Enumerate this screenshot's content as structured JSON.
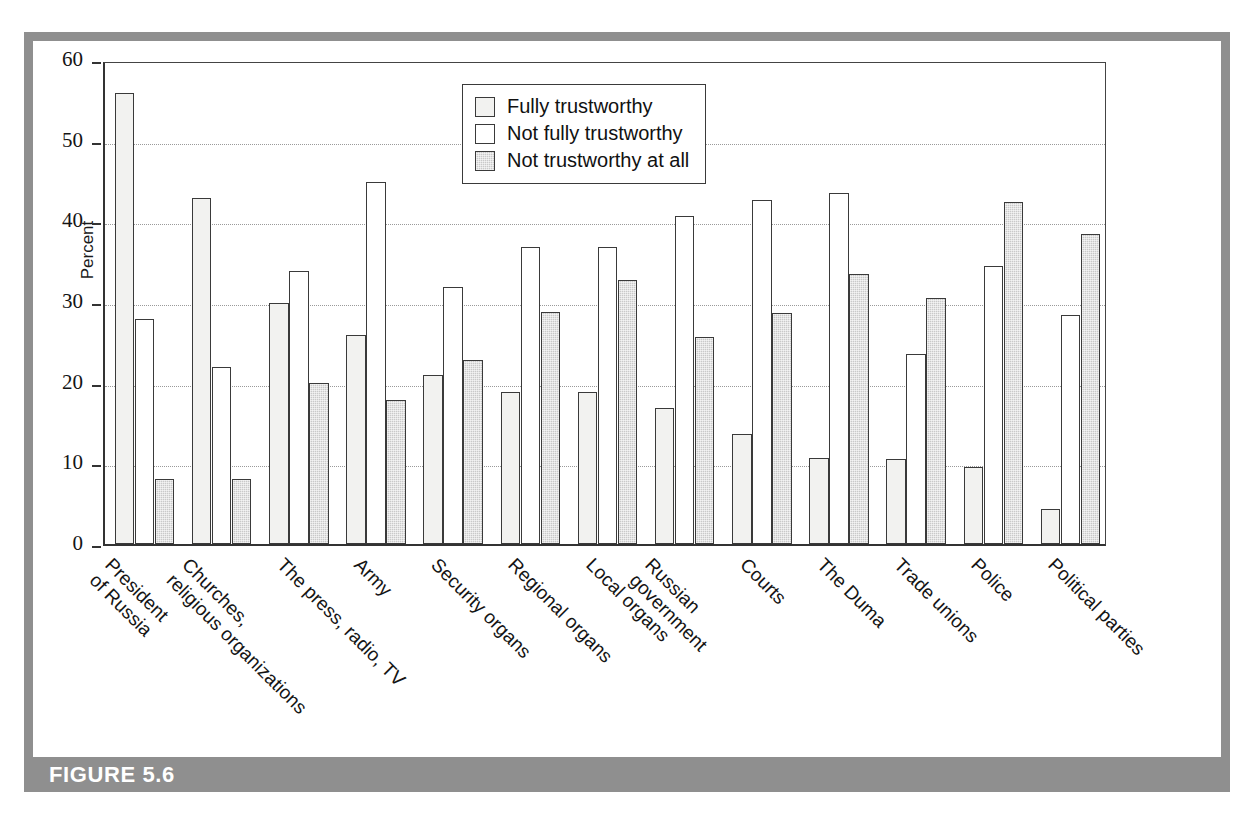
{
  "figure": {
    "caption_label": "FIGURE 5.6",
    "band_color": "#8f8f8f",
    "frame_color": "#8f8f8f"
  },
  "legend": {
    "position": "top-center-inside",
    "items": [
      {
        "label": "Fully trustworthy",
        "color": "#f2f2f0"
      },
      {
        "label": "Not fully trustworthy",
        "color": "#ffffff"
      },
      {
        "label": "Not trustworthy at all",
        "color": "#c9c9c9"
      }
    ]
  },
  "axes": {
    "y_title": "Percent",
    "y_ticks": [
      "0",
      "10",
      "20",
      "30",
      "40",
      "50",
      "60"
    ],
    "y_min": 0,
    "y_max": 60,
    "grid": "horizontal-dotted"
  },
  "chart_data": {
    "type": "bar",
    "title": "",
    "xlabel": "",
    "ylabel": "Percent",
    "ylim": [
      0,
      60
    ],
    "grid": true,
    "legend_position": "top-center",
    "categories": [
      "President of Russia",
      "Churches, religious organizations",
      "The press, radio, TV",
      "Army",
      "Security organs",
      "Regional organs",
      "Local organs",
      "Russian government",
      "Courts",
      "The Duma",
      "Trade unions",
      "Police",
      "Political parties"
    ],
    "category_lines": [
      [
        "President",
        "of Russia"
      ],
      [
        "Churches,",
        "religious organizations"
      ],
      [
        "The press, radio, TV",
        ""
      ],
      [
        "Army",
        ""
      ],
      [
        "Security organs",
        ""
      ],
      [
        "Regional organs",
        ""
      ],
      [
        "Local organs",
        ""
      ],
      [
        "Russian",
        "government"
      ],
      [
        "Courts",
        ""
      ],
      [
        "The Duma",
        ""
      ],
      [
        "Trade unions",
        ""
      ],
      [
        "Police",
        ""
      ],
      [
        "Political parties",
        ""
      ]
    ],
    "series": [
      {
        "name": "Fully trustworthy",
        "color": "#f2f2f0",
        "values": [
          55.9,
          42.9,
          29.9,
          25.9,
          20.9,
          18.9,
          18.9,
          16.9,
          13.7,
          10.7,
          10.6,
          9.5,
          4.4
        ]
      },
      {
        "name": "Not fully trustworthy",
        "color": "#ffffff",
        "values": [
          27.9,
          21.9,
          33.9,
          44.9,
          31.8,
          36.8,
          36.8,
          40.7,
          42.6,
          43.5,
          23.5,
          34.5,
          28.4
        ]
      },
      {
        "name": "Not trustworthy at all",
        "color": "#c9c9c9",
        "values": [
          8.0,
          8.0,
          19.9,
          17.9,
          22.8,
          28.8,
          32.7,
          25.7,
          28.6,
          33.5,
          30.5,
          42.4,
          38.4
        ]
      }
    ]
  }
}
